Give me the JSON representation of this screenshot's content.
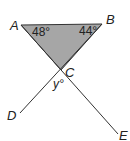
{
  "diagram": {
    "type": "geometry",
    "colors": {
      "triangle_fill": "#a6a6a6",
      "stroke": "#333333",
      "text": "#222222",
      "background": "#ffffff"
    },
    "points": {
      "A": {
        "label": "A",
        "x": 21,
        "y": 25
      },
      "B": {
        "label": "B",
        "x": 102,
        "y": 24
      },
      "C": {
        "label": "C",
        "x": 61,
        "y": 70
      },
      "D": {
        "label": "D",
        "x": 20,
        "y": 113
      },
      "E": {
        "label": "E",
        "x": 118,
        "y": 134
      }
    },
    "angles": {
      "A": {
        "label": "48°",
        "value": 48
      },
      "B": {
        "label": "44°",
        "value": 44
      },
      "C_vertical": {
        "label": "y°",
        "variable": "y"
      }
    },
    "segments": [
      {
        "from": "A",
        "to": "B"
      },
      {
        "from": "A",
        "to": "E"
      },
      {
        "from": "B",
        "to": "D"
      }
    ]
  }
}
